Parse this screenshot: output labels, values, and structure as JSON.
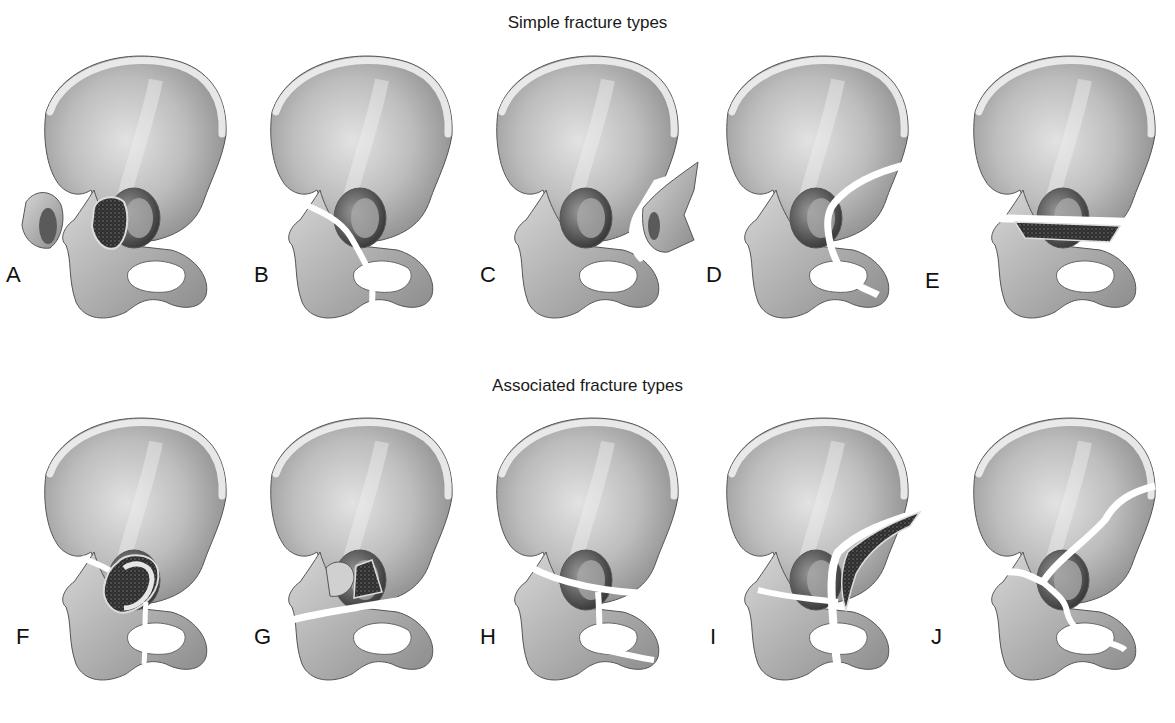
{
  "figure": {
    "rows": [
      {
        "title": "Simple fracture types",
        "panels": [
          {
            "label": "A",
            "fracture": "posterior wall"
          },
          {
            "label": "B",
            "fracture": "posterior column"
          },
          {
            "label": "C",
            "fracture": "anterior wall"
          },
          {
            "label": "D",
            "fracture": "anterior column"
          },
          {
            "label": "E",
            "fracture": "transverse"
          }
        ]
      },
      {
        "title": "Associated fracture types",
        "panels": [
          {
            "label": "F",
            "fracture": "posterior column and posterior wall"
          },
          {
            "label": "G",
            "fracture": "transverse and posterior wall"
          },
          {
            "label": "H",
            "fracture": "T-shaped"
          },
          {
            "label": "I",
            "fracture": "anterior column and posterior hemitransverse"
          },
          {
            "label": "J",
            "fracture": "both-column"
          }
        ]
      }
    ]
  },
  "colors": {
    "background": "#ffffff",
    "bone_fill": "#bdbdbd",
    "bone_light": "#e6e6e6",
    "bone_dark": "#7a7a7a",
    "cancellous": "#3a3a3a",
    "outline": "#555555",
    "text": "#111111"
  }
}
